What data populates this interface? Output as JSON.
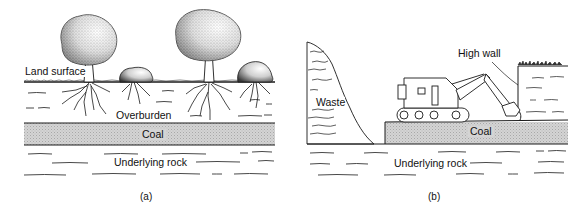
{
  "panel_a": {
    "caption": "(a)",
    "labels": {
      "land_surface": "Land surface",
      "overburden": "Overburden",
      "coal": "Coal",
      "underlying_rock": "Underlying rock"
    }
  },
  "panel_b": {
    "caption": "(b)",
    "labels": {
      "high_wall": "High wall",
      "waste": "Waste",
      "coal": "Coal",
      "underlying_rock": "Underlying rock"
    }
  },
  "colors": {
    "line": "#1a1a1a",
    "coal_fill": "#cfcfcf",
    "foliage": "#9a9a9a"
  }
}
